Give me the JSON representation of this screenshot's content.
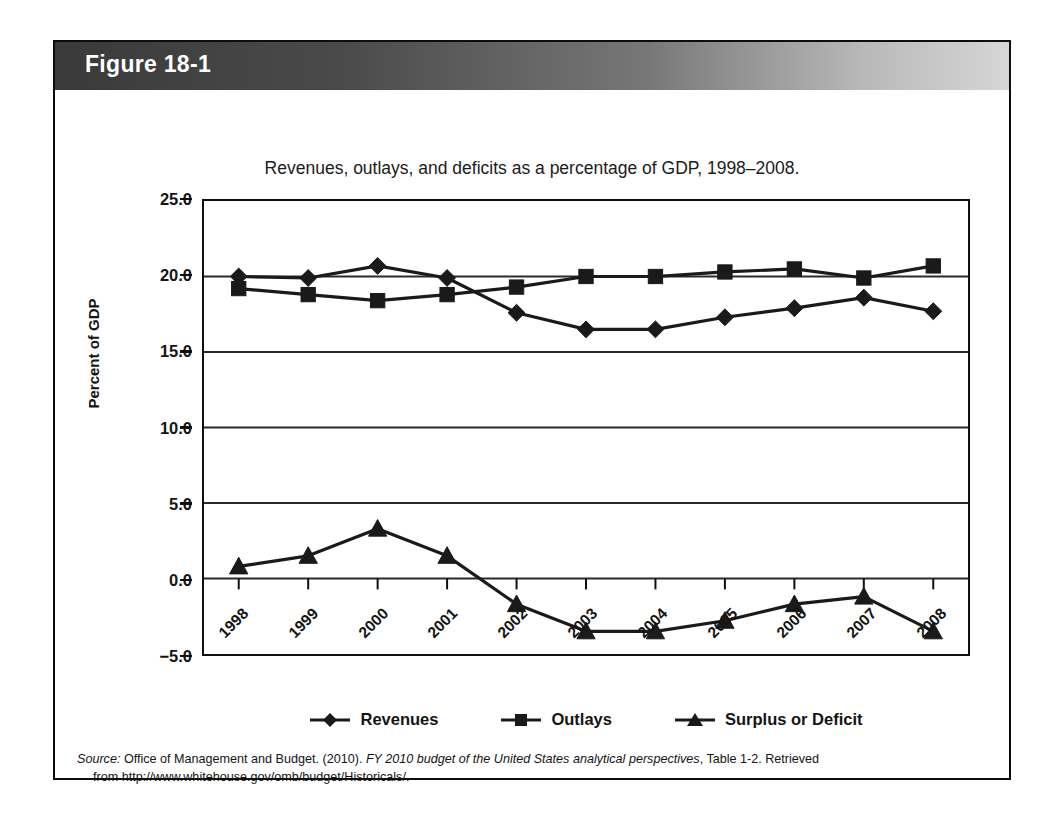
{
  "figure": {
    "header_label": "Figure 18-1",
    "title": "Revenues, outlays, and deficits as a percentage of GDP, 1998–2008."
  },
  "source": {
    "label": "Source:",
    "text_before_italic": " Office of Management and Budget. (2010). ",
    "italic_title": "FY 2010 budget of the United States analytical perspectives",
    "text_after_italic": ", Table 1-2. Retrieved",
    "line2": "from http://www.whitehouse.gov/omb/budget/Historicals/."
  },
  "legend": {
    "items": [
      {
        "label": "Revenues",
        "marker": "diamond-marker"
      },
      {
        "label": "Outlays",
        "marker": "square-marker"
      },
      {
        "label": "Surplus or Deficit",
        "marker": "triangle-marker"
      }
    ]
  },
  "colors": {
    "line": "#1a1a1a",
    "axis": "#0f0f0f",
    "grid": "#2a2a2a",
    "header_dark": "#3a3a3a",
    "header_light": "#d6d6d6",
    "background": "#ffffff"
  },
  "chart_data": {
    "type": "line",
    "title": "Revenues, outlays, and deficits as a percentage of GDP, 1998–2008.",
    "xlabel": "",
    "ylabel": "Percent of GDP",
    "categories": [
      "1998",
      "1999",
      "2000",
      "2001",
      "2002",
      "2003",
      "2004",
      "2005",
      "2006",
      "2007",
      "2008"
    ],
    "ylim": [
      -5.0,
      25.0
    ],
    "ytick_labels": [
      "25.0",
      "20.0",
      "15.0",
      "10.0",
      "5.0",
      "0.0",
      "−5.0"
    ],
    "ytick_values": [
      25.0,
      20.0,
      15.0,
      10.0,
      5.0,
      0.0,
      -5.0
    ],
    "grid": true,
    "grid_axis": "y",
    "legend_position": "bottom",
    "series": [
      {
        "name": "Revenues",
        "marker": "diamond",
        "values": [
          20.0,
          19.9,
          20.7,
          19.9,
          17.6,
          16.5,
          16.5,
          17.3,
          17.9,
          18.6,
          17.7
        ]
      },
      {
        "name": "Outlays",
        "marker": "square",
        "values": [
          19.2,
          18.8,
          18.4,
          18.8,
          19.3,
          20.0,
          20.0,
          20.3,
          20.5,
          19.9,
          20.7
        ]
      },
      {
        "name": "Surplus or Deficit",
        "marker": "triangle",
        "values": [
          0.8,
          1.5,
          3.3,
          1.5,
          -1.7,
          -3.5,
          -3.5,
          -2.8,
          -1.7,
          -1.2,
          -3.5
        ]
      }
    ]
  }
}
